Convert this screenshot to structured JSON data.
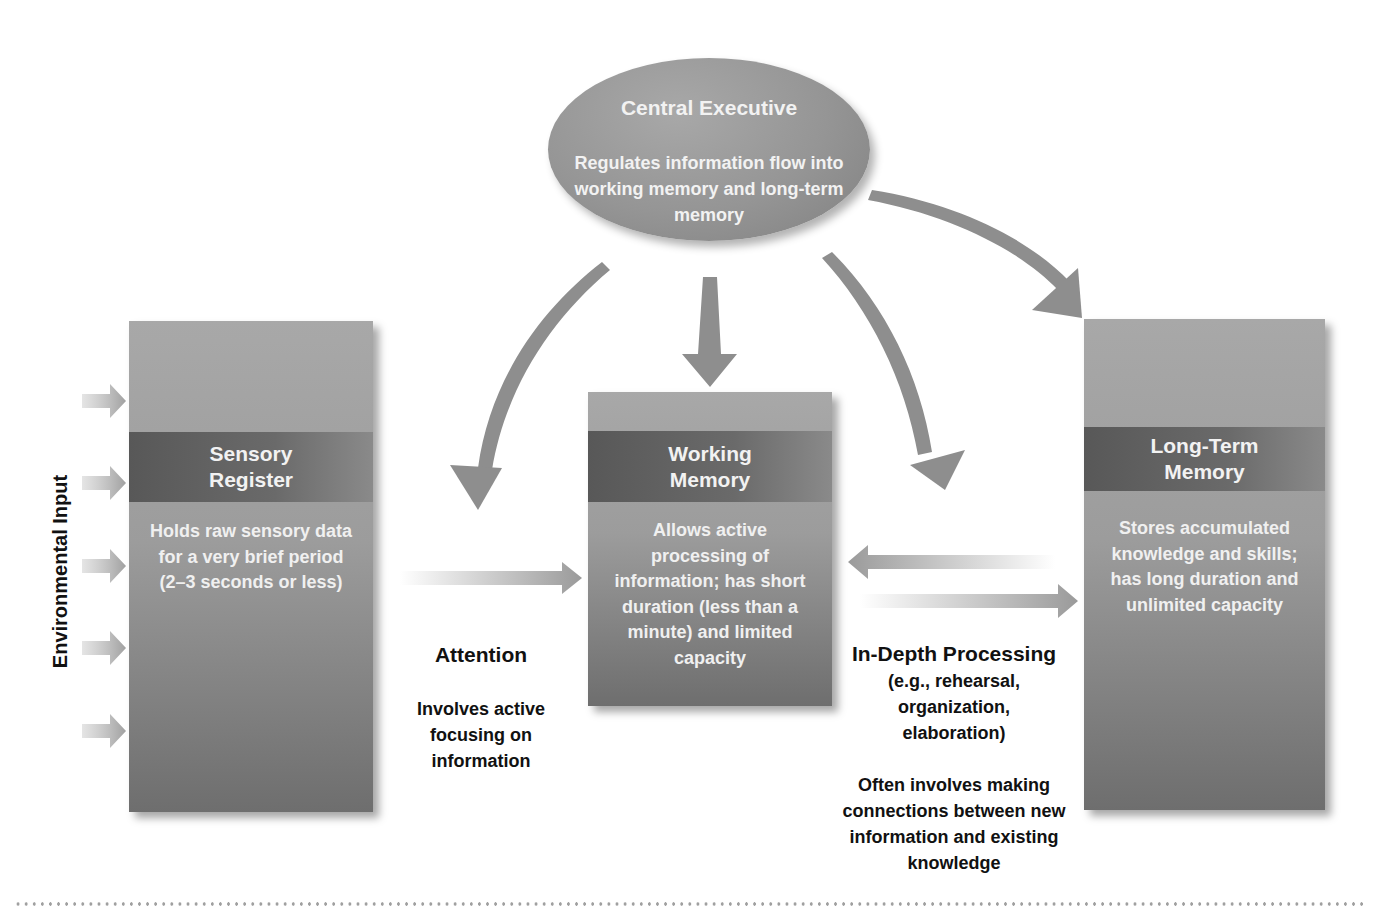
{
  "central_executive": {
    "title": "Central Executive",
    "description": "Regulates information flow into working memory and long-term memory"
  },
  "environmental_input": {
    "label": "Environmental Input",
    "arrow_count": 5
  },
  "sensory_register": {
    "title_line1": "Sensory",
    "title_line2": "Register",
    "description": "Holds raw sensory data for a very brief period (2–3 seconds or less)"
  },
  "working_memory": {
    "title_line1": "Working",
    "title_line2": "Memory",
    "description": "Allows active processing of information; has short duration (less than a minute) and limited capacity"
  },
  "long_term_memory": {
    "title_line1": "Long-Term",
    "title_line2": "Memory",
    "description": "Stores accumulated knowledge and skills; has long duration and unlimited capacity"
  },
  "attention": {
    "title": "Attention",
    "description": "Involves active focusing on information"
  },
  "in_depth_processing": {
    "title": "In-Depth Processing",
    "examples": "(e.g., rehearsal, organization, elaboration)",
    "description": "Often involves making connections between new information and existing knowledge"
  },
  "colors": {
    "box_gray": "#9c9c9c",
    "title_band": "#5e5e5e",
    "arrow_gray": "#8c8c8c",
    "text_dark": "#111111",
    "text_light": "#f0f0f0"
  }
}
